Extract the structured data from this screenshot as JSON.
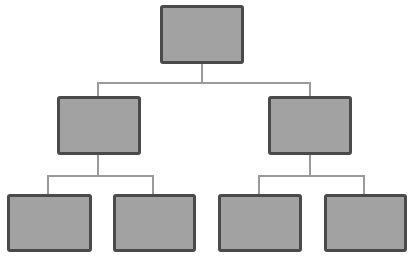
{
  "diagram": {
    "type": "org-chart",
    "levels": 3,
    "colors": {
      "node_fill": "#a2a2a2",
      "node_border": "#4a4a4a",
      "connector": "#9a9a9a",
      "background": "#ffffff"
    },
    "nodes": [
      {
        "id": "root",
        "label": "",
        "level": 0,
        "x": 160,
        "y": 5,
        "w": 84,
        "h": 59
      },
      {
        "id": "l1-left",
        "label": "",
        "level": 1,
        "parent": "root",
        "x": 57,
        "y": 96,
        "w": 84,
        "h": 59
      },
      {
        "id": "l1-right",
        "label": "",
        "level": 1,
        "parent": "root",
        "x": 268,
        "y": 96,
        "w": 84,
        "h": 59
      },
      {
        "id": "l2-1",
        "label": "",
        "level": 2,
        "parent": "l1-left",
        "x": 7,
        "y": 194,
        "w": 85,
        "h": 58
      },
      {
        "id": "l2-2",
        "label": "",
        "level": 2,
        "parent": "l1-left",
        "x": 113,
        "y": 194,
        "w": 83,
        "h": 58
      },
      {
        "id": "l2-3",
        "label": "",
        "level": 2,
        "parent": "l1-right",
        "x": 218,
        "y": 194,
        "w": 84,
        "h": 58
      },
      {
        "id": "l2-4",
        "label": "",
        "level": 2,
        "parent": "l1-right",
        "x": 324,
        "y": 194,
        "w": 83,
        "h": 58
      }
    ]
  }
}
